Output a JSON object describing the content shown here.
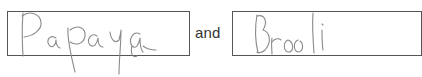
{
  "fields": [
    {
      "id": "word-1",
      "handwritten_value": "Papaya",
      "ink_color": "#8a8a8a"
    },
    {
      "id": "word-2",
      "handwritten_value": "Broccoli",
      "ink_color": "#8a8a8a"
    }
  ],
  "connector_text": "and",
  "colors": {
    "box_border": "#555555",
    "text": "#333333",
    "background": "#ffffff"
  }
}
